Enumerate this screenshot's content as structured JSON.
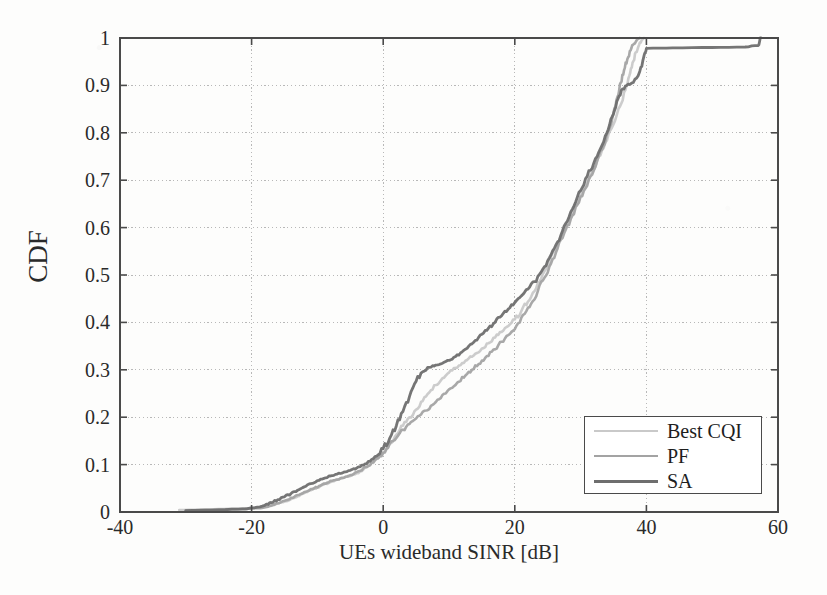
{
  "chart_data": {
    "type": "line",
    "title": "",
    "subtitle": "",
    "xlabel": "UEs wideband SINR [dB]",
    "ylabel": "CDF",
    "xlim": [
      -40,
      60
    ],
    "ylim": [
      0,
      1
    ],
    "xticks": [
      -40,
      -20,
      0,
      20,
      40,
      60
    ],
    "xtick_labels": [
      "-40",
      "-20",
      "0",
      "20",
      "40",
      "60"
    ],
    "yticks": [
      0,
      0.1,
      0.2,
      0.3,
      0.4,
      0.5,
      0.6,
      0.7,
      0.8,
      0.9,
      1
    ],
    "ytick_labels": [
      "0",
      "0.1",
      "0.2",
      "0.3",
      "0.4",
      "0.5",
      "0.6",
      "0.7",
      "0.8",
      "0.9",
      "1"
    ],
    "grid": true,
    "grid_style": "dotted",
    "legend_position": "lower right",
    "series": [
      {
        "name": "Best CQI",
        "color": "#c9c9c9",
        "linewidth": 2.6,
        "points": [
          [
            -31.0,
            0.004
          ],
          [
            -28.0,
            0.005
          ],
          [
            -25.0,
            0.006
          ],
          [
            -22.0,
            0.007
          ],
          [
            -20.0,
            0.008
          ],
          [
            -18.5,
            0.01
          ],
          [
            -17.0,
            0.013
          ],
          [
            -16.0,
            0.018
          ],
          [
            -15.0,
            0.022
          ],
          [
            -14.0,
            0.027
          ],
          [
            -13.0,
            0.033
          ],
          [
            -12.0,
            0.04
          ],
          [
            -11.0,
            0.046
          ],
          [
            -10.0,
            0.052
          ],
          [
            -9.0,
            0.058
          ],
          [
            -8.0,
            0.063
          ],
          [
            -7.0,
            0.068
          ],
          [
            -6.0,
            0.072
          ],
          [
            -5.0,
            0.076
          ],
          [
            -4.0,
            0.082
          ],
          [
            -3.0,
            0.09
          ],
          [
            -2.0,
            0.1
          ],
          [
            -1.0,
            0.112
          ],
          [
            0.0,
            0.126
          ],
          [
            1.0,
            0.144
          ],
          [
            2.0,
            0.163
          ],
          [
            3.0,
            0.182
          ],
          [
            4.0,
            0.2
          ],
          [
            5.0,
            0.216
          ],
          [
            6.0,
            0.234
          ],
          [
            7.0,
            0.252
          ],
          [
            8.0,
            0.268
          ],
          [
            9.0,
            0.282
          ],
          [
            10.0,
            0.294
          ],
          [
            11.0,
            0.304
          ],
          [
            12.0,
            0.314
          ],
          [
            13.0,
            0.324
          ],
          [
            14.0,
            0.334
          ],
          [
            15.0,
            0.345
          ],
          [
            16.0,
            0.356
          ],
          [
            17.0,
            0.368
          ],
          [
            18.0,
            0.38
          ],
          [
            19.0,
            0.392
          ],
          [
            20.0,
            0.406
          ],
          [
            21.0,
            0.424
          ],
          [
            22.0,
            0.444
          ],
          [
            23.0,
            0.466
          ],
          [
            24.0,
            0.492
          ],
          [
            25.0,
            0.52
          ],
          [
            26.0,
            0.55
          ],
          [
            27.0,
            0.58
          ],
          [
            28.0,
            0.61
          ],
          [
            29.0,
            0.64
          ],
          [
            30.0,
            0.668
          ],
          [
            31.0,
            0.694
          ],
          [
            32.0,
            0.722
          ],
          [
            33.0,
            0.752
          ],
          [
            34.0,
            0.784
          ],
          [
            35.0,
            0.818
          ],
          [
            36.0,
            0.856
          ],
          [
            36.8,
            0.89
          ],
          [
            37.4,
            0.92
          ],
          [
            37.9,
            0.948
          ],
          [
            38.4,
            0.97
          ],
          [
            38.9,
            0.986
          ],
          [
            39.3,
            0.996
          ],
          [
            39.6,
            1.0
          ]
        ]
      },
      {
        "name": "PF",
        "color": "#a3a3a3",
        "linewidth": 2.6,
        "points": [
          [
            -30.0,
            0.003
          ],
          [
            -27.0,
            0.004
          ],
          [
            -24.0,
            0.005
          ],
          [
            -21.0,
            0.006
          ],
          [
            -19.0,
            0.008
          ],
          [
            -17.5,
            0.011
          ],
          [
            -16.5,
            0.016
          ],
          [
            -15.5,
            0.021
          ],
          [
            -14.5,
            0.026
          ],
          [
            -13.5,
            0.032
          ],
          [
            -12.5,
            0.038
          ],
          [
            -11.5,
            0.044
          ],
          [
            -10.5,
            0.05
          ],
          [
            -9.5,
            0.056
          ],
          [
            -8.5,
            0.062
          ],
          [
            -7.5,
            0.067
          ],
          [
            -6.5,
            0.071
          ],
          [
            -5.5,
            0.075
          ],
          [
            -4.5,
            0.08
          ],
          [
            -3.5,
            0.087
          ],
          [
            -2.5,
            0.095
          ],
          [
            -1.5,
            0.105
          ],
          [
            -0.5,
            0.118
          ],
          [
            0.5,
            0.133
          ],
          [
            1.5,
            0.15
          ],
          [
            2.5,
            0.166
          ],
          [
            3.5,
            0.18
          ],
          [
            4.5,
            0.192
          ],
          [
            5.5,
            0.203
          ],
          [
            6.5,
            0.214
          ],
          [
            7.5,
            0.226
          ],
          [
            8.5,
            0.238
          ],
          [
            9.5,
            0.25
          ],
          [
            10.5,
            0.262
          ],
          [
            11.5,
            0.275
          ],
          [
            12.5,
            0.288
          ],
          [
            13.5,
            0.3
          ],
          [
            14.5,
            0.312
          ],
          [
            15.5,
            0.325
          ],
          [
            16.5,
            0.338
          ],
          [
            17.5,
            0.352
          ],
          [
            18.5,
            0.366
          ],
          [
            19.5,
            0.38
          ],
          [
            20.5,
            0.398
          ],
          [
            21.5,
            0.418
          ],
          [
            22.5,
            0.44
          ],
          [
            23.5,
            0.466
          ],
          [
            24.5,
            0.494
          ],
          [
            25.5,
            0.524
          ],
          [
            26.5,
            0.556
          ],
          [
            27.5,
            0.588
          ],
          [
            28.5,
            0.618
          ],
          [
            29.5,
            0.648
          ],
          [
            30.5,
            0.678
          ],
          [
            31.5,
            0.708
          ],
          [
            32.5,
            0.74
          ],
          [
            33.5,
            0.772
          ],
          [
            34.3,
            0.806
          ],
          [
            35.0,
            0.842
          ],
          [
            35.6,
            0.876
          ],
          [
            36.1,
            0.906
          ],
          [
            36.6,
            0.932
          ],
          [
            37.1,
            0.955
          ],
          [
            37.6,
            0.974
          ],
          [
            38.1,
            0.988
          ],
          [
            38.6,
            0.997
          ],
          [
            39.0,
            1.0
          ]
        ]
      },
      {
        "name": "SA",
        "color": "#6e6e6e",
        "linewidth": 2.8,
        "points": [
          [
            -30.0,
            0.003
          ],
          [
            -26.0,
            0.004
          ],
          [
            -22.0,
            0.006
          ],
          [
            -19.5,
            0.009
          ],
          [
            -18.0,
            0.014
          ],
          [
            -17.0,
            0.02
          ],
          [
            -16.0,
            0.026
          ],
          [
            -15.0,
            0.032
          ],
          [
            -14.0,
            0.039
          ],
          [
            -13.0,
            0.046
          ],
          [
            -12.0,
            0.053
          ],
          [
            -11.0,
            0.06
          ],
          [
            -10.0,
            0.066
          ],
          [
            -9.0,
            0.071
          ],
          [
            -8.0,
            0.076
          ],
          [
            -7.0,
            0.08
          ],
          [
            -6.0,
            0.084
          ],
          [
            -5.0,
            0.088
          ],
          [
            -4.0,
            0.093
          ],
          [
            -3.0,
            0.099
          ],
          [
            -2.0,
            0.107
          ],
          [
            -1.0,
            0.118
          ],
          [
            0.0,
            0.134
          ],
          [
            1.0,
            0.156
          ],
          [
            2.0,
            0.182
          ],
          [
            3.0,
            0.212
          ],
          [
            4.0,
            0.244
          ],
          [
            5.0,
            0.276
          ],
          [
            6.0,
            0.296
          ],
          [
            7.0,
            0.305
          ],
          [
            8.0,
            0.31
          ],
          [
            9.0,
            0.314
          ],
          [
            10.0,
            0.32
          ],
          [
            11.0,
            0.328
          ],
          [
            12.0,
            0.338
          ],
          [
            13.0,
            0.35
          ],
          [
            14.0,
            0.362
          ],
          [
            15.0,
            0.375
          ],
          [
            16.0,
            0.388
          ],
          [
            17.0,
            0.4
          ],
          [
            18.0,
            0.414
          ],
          [
            19.0,
            0.428
          ],
          [
            20.0,
            0.442
          ],
          [
            21.0,
            0.456
          ],
          [
            22.0,
            0.47
          ],
          [
            23.0,
            0.486
          ],
          [
            24.0,
            0.506
          ],
          [
            25.0,
            0.53
          ],
          [
            26.0,
            0.556
          ],
          [
            27.0,
            0.584
          ],
          [
            28.0,
            0.614
          ],
          [
            29.0,
            0.646
          ],
          [
            30.0,
            0.678
          ],
          [
            31.0,
            0.708
          ],
          [
            32.0,
            0.736
          ],
          [
            33.0,
            0.766
          ],
          [
            34.0,
            0.8
          ],
          [
            34.8,
            0.834
          ],
          [
            35.5,
            0.866
          ],
          [
            36.2,
            0.89
          ],
          [
            37.0,
            0.9
          ],
          [
            38.0,
            0.906
          ],
          [
            39.0,
            0.93
          ],
          [
            39.6,
            0.96
          ],
          [
            40.0,
            0.978
          ],
          [
            44.0,
            0.979
          ],
          [
            50.0,
            0.98
          ],
          [
            55.0,
            0.981
          ],
          [
            57.0,
            0.984
          ],
          [
            57.4,
            1.0
          ]
        ]
      }
    ]
  },
  "legend": {
    "entries": [
      {
        "label": "Best CQI",
        "color": "#c9c9c9"
      },
      {
        "label": "PF",
        "color": "#a3a3a3"
      },
      {
        "label": "SA",
        "color": "#6e6e6e"
      }
    ]
  },
  "colors": {
    "axis": "#4a4a4a",
    "grid": "#b8b8b8",
    "text": "#2a2a2a",
    "background": "#fdfdfc"
  }
}
